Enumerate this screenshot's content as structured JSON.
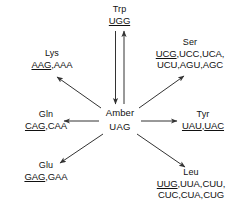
{
  "diagram": {
    "center": {
      "name": "Amber",
      "codon": "UAG",
      "underlined": false
    },
    "nodes": [
      {
        "id": "trp",
        "name": "Trp",
        "codon_lines": [
          "UGG"
        ],
        "underlined_codons": [
          "UGG"
        ],
        "arrow": "bidirectional-vertical"
      },
      {
        "id": "lys",
        "name": "Lys",
        "codon_lines": [
          "AAG,AAA"
        ],
        "underlined_codons": [
          "AAG"
        ],
        "arrow": "up-left"
      },
      {
        "id": "ser",
        "name": "Ser",
        "codon_lines": [
          "UCG,UCC,UCA,",
          "UCU,AGU,AGC"
        ],
        "underlined_codons": [
          "UCG"
        ],
        "arrow": "up-right"
      },
      {
        "id": "gln",
        "name": "Gln",
        "codon_lines": [
          "CAG,CAA"
        ],
        "underlined_codons": [
          "CAG"
        ],
        "arrow": "left"
      },
      {
        "id": "tyr",
        "name": "Tyr",
        "codon_lines": [
          "UAU,UAC"
        ],
        "underlined_codons": [
          "UAU",
          "UAC"
        ],
        "arrow": "right"
      },
      {
        "id": "glu",
        "name": "Glu",
        "codon_lines": [
          "GAG,GAA"
        ],
        "underlined_codons": [
          "GAG"
        ],
        "arrow": "down-left"
      },
      {
        "id": "leu",
        "name": "Leu",
        "codon_lines": [
          "UUG,UUA,CUU,",
          "CUC,CUA,CUG"
        ],
        "underlined_codons": [
          "UUG"
        ],
        "arrow": "down-right"
      }
    ],
    "colors": {
      "background": "#ffffff",
      "text": "#111111",
      "arrow": "#333333"
    }
  },
  "labels": {
    "trp_name": "Trp",
    "trp_codons_1": "UGG",
    "lys_name": "Lys",
    "lys_codons_1_u": "AAG",
    "lys_codons_1_rest": ",AAA",
    "ser_name": "Ser",
    "ser_codons_1_u": "UCG",
    "ser_codons_1_rest": ",UCC,UCA,",
    "ser_codons_2": "UCU,AGU,AGC",
    "gln_name": "Gln",
    "gln_codons_1_u": "CAG",
    "gln_codons_1_rest": ",CAA",
    "tyr_name": "Tyr",
    "tyr_codons_1_u": "UAU",
    "tyr_codons_1_sep": ",",
    "tyr_codons_1_u2": "UAC",
    "glu_name": "Glu",
    "glu_codons_1_u": "GAG",
    "glu_codons_1_rest": ",GAA",
    "leu_name": "Leu",
    "leu_codons_1_u": "UUG",
    "leu_codons_1_rest": ",UUA,CUU,",
    "leu_codons_2": "CUC,CUA,CUG",
    "center_name": "Amber",
    "center_codon": "UAG"
  }
}
